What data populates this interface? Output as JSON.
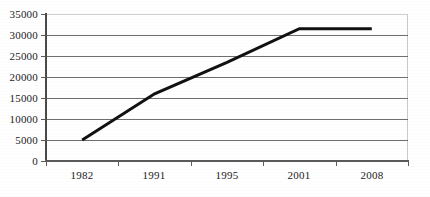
{
  "chart_data": {
    "type": "line",
    "title": "",
    "subtitle": "",
    "xlabel": "",
    "ylabel": "",
    "categories": [
      "1982",
      "1991",
      "1995",
      "2001",
      "2008"
    ],
    "series": [
      {
        "name": "series-1",
        "values": [
          5000,
          16000,
          23500,
          31500,
          31500
        ]
      }
    ],
    "ylim": [
      0,
      35000
    ],
    "yticks": [
      0,
      5000,
      10000,
      15000,
      20000,
      25000,
      30000,
      35000
    ],
    "ytick_labels": [
      "0",
      "5000",
      "10000",
      "15000",
      "20000",
      "25000",
      "30000",
      "35000"
    ],
    "grid": true,
    "grid_axis": "y",
    "legend": false,
    "legend_position": "none",
    "line_color": "#111111",
    "grid_color": "#6e6e6e",
    "axis_color": "#4a4a4a",
    "background_color": "#ffffff",
    "annotations": []
  },
  "axes": {
    "y_labels": [
      "35000",
      "30000",
      "25000",
      "20000",
      "15000",
      "10000",
      "5000",
      "0"
    ],
    "x_labels": [
      "1982",
      "1991",
      "1995",
      "2001",
      "2008"
    ]
  }
}
